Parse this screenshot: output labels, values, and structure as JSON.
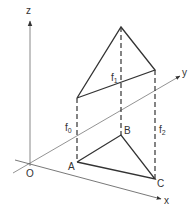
{
  "diagram": {
    "type": "3d-prism-surface-coordinate-figure",
    "colors": {
      "axis": "#888888",
      "edge": "#333333",
      "dashed": "#333333",
      "text": "#333333",
      "background": "#ffffff"
    },
    "axes": {
      "z": {
        "label": "z"
      },
      "y": {
        "label": "y"
      },
      "x": {
        "label": "x"
      },
      "origin": {
        "label": "O"
      }
    },
    "points": {
      "A": {
        "label": "A"
      },
      "B": {
        "label": "B"
      },
      "C": {
        "label": "C"
      }
    },
    "heights": {
      "f0": {
        "base": "f",
        "sub": "0"
      },
      "f1": {
        "base": "f",
        "sub": "1"
      },
      "f2": {
        "base": "f",
        "sub": "2"
      }
    }
  }
}
